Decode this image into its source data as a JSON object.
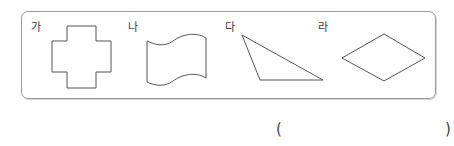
{
  "question": {
    "shapes": [
      {
        "label": "가",
        "type": "cross-polygon"
      },
      {
        "label": "나",
        "type": "curved-sided-shape"
      },
      {
        "label": "다",
        "type": "triangle"
      },
      {
        "label": "라",
        "type": "rhombus"
      }
    ],
    "answer": {
      "open_paren": "(",
      "close_paren": ")",
      "value": ""
    }
  },
  "colors": {
    "stroke": "#555555",
    "box_border": "#9a9a9a"
  }
}
